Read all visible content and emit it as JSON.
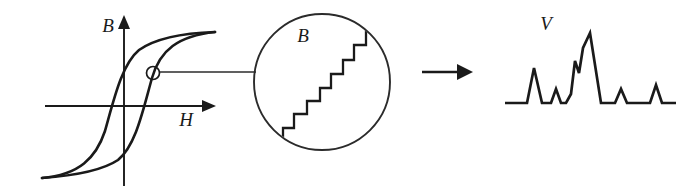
{
  "figure": {
    "width": 699,
    "height": 196,
    "background_color": "#ffffff",
    "ink_color": "#1a1a1a"
  },
  "panels": {
    "hysteresis": {
      "name": "hysteresis-loop",
      "y_axis_label": "B",
      "x_axis_label": "H",
      "y_axis_label_pos": {
        "x": 108,
        "y": 32
      },
      "x_axis_label_pos": {
        "x": 186,
        "y": 126
      },
      "origin": {
        "x": 124,
        "y": 106
      },
      "x_axis": {
        "x1": 45,
        "y1": 106,
        "x2": 203,
        "y2": 106
      },
      "y_axis": {
        "x1": 124,
        "y1": 185,
        "x2": 124,
        "y2": 27
      },
      "marker": {
        "x": 153,
        "y": 73,
        "r": 6.5,
        "label": "operating-point"
      },
      "upper_branch": "M 42,178 C 70,176 100,172 118,160 C 136,145 143,110 152,78 C 160,50 178,36 215,32",
      "lower_branch": "M 215,32 C 186,33 156,38 139,50 C 122,64 114,99 105,131 C 96,158 79,175 42,178"
    },
    "magnifier": {
      "name": "magnified-inset",
      "label": "B",
      "label_pos": {
        "x": 303,
        "y": 42
      },
      "circle": {
        "cx": 322,
        "cy": 82,
        "r": 68
      },
      "leader_line": {
        "x1": 160,
        "y1": 72,
        "x2": 256,
        "y2": 72
      },
      "staircase_steps": 8,
      "staircase_path": "M 283,150 L 283,128 L 294,128 L 294,114 L 307,114 L 307,101 L 320,101 L 320,88 L 331,88 L 331,74 L 343,74 L 343,60 L 354,60 L 354,45 L 366,45 L 366,28 L 372,28"
    },
    "transition_arrow": {
      "name": "process-arrow",
      "shaft": {
        "x1": 422,
        "y1": 72,
        "x2": 458,
        "y2": 72
      },
      "head": "M 458,65 L 472,72 L 458,79 Z"
    },
    "signal": {
      "name": "voltage-trace",
      "label": "V",
      "label_pos": {
        "x": 546,
        "y": 30
      },
      "baseline_y": 103,
      "trace_path": "M 505,103 L 527,103 L 534,68 L 542,103 L 551,103 L 556,89 L 561,103 L 566,103 L 571,94 L 575,61 L 579,73 L 583,48 L 590,33 L 601,103 L 615,103 L 621,89 L 627,103 L 650,103 L 656,85 L 662,103 L 676,103",
      "pulses": [
        {
          "peak_x": 534,
          "peak_y": 68,
          "amplitude": 35
        },
        {
          "peak_x": 556,
          "peak_y": 89,
          "amplitude": 14
        },
        {
          "peak_x": 575,
          "peak_y": 61,
          "amplitude": 42
        },
        {
          "peak_x": 590,
          "peak_y": 33,
          "amplitude": 70
        },
        {
          "peak_x": 621,
          "peak_y": 89,
          "amplitude": 14
        },
        {
          "peak_x": 656,
          "peak_y": 85,
          "amplitude": 18
        }
      ]
    }
  }
}
